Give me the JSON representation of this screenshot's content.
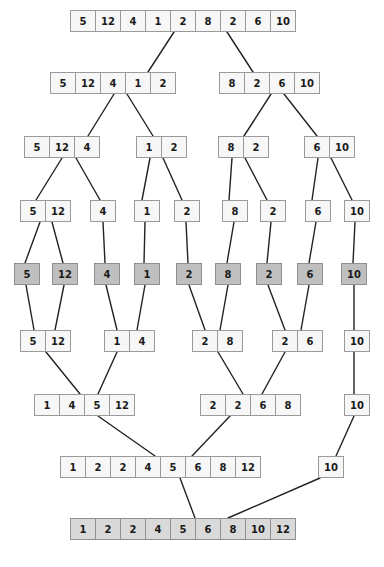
{
  "diagram": {
    "cell_width": 26,
    "cell_height": 22,
    "colors": {
      "cell_fill": "#f7f7f7",
      "base_fill": "#bfbfbf",
      "result_fill": "#d9d9d9",
      "border": "#9a9a9a",
      "edge": "#222222",
      "text": "#1a1a1a",
      "background": "#ffffff"
    },
    "levels": [
      {
        "name": "input",
        "role": "divide",
        "y": 10,
        "nodes": [
          {
            "x": 70,
            "values": [
              5,
              12,
              4,
              1,
              2,
              8,
              2,
              6,
              10
            ],
            "style": "plain"
          }
        ]
      },
      {
        "name": "divide-1",
        "role": "divide",
        "y": 72,
        "nodes": [
          {
            "x": 50,
            "values": [
              5,
              12,
              4,
              1,
              2
            ],
            "style": "plain"
          },
          {
            "x": 219,
            "values": [
              8,
              2,
              6,
              10
            ],
            "style": "plain"
          }
        ]
      },
      {
        "name": "divide-2",
        "role": "divide",
        "y": 136,
        "nodes": [
          {
            "x": 24,
            "values": [
              5,
              12,
              4
            ],
            "style": "plain"
          },
          {
            "x": 136,
            "values": [
              1,
              2
            ],
            "style": "plain"
          },
          {
            "x": 218,
            "values": [
              8,
              2
            ],
            "style": "plain"
          },
          {
            "x": 304,
            "values": [
              6,
              10
            ],
            "style": "plain"
          }
        ]
      },
      {
        "name": "divide-3",
        "role": "divide",
        "y": 200,
        "nodes": [
          {
            "x": 20,
            "values": [
              5,
              12
            ],
            "style": "plain"
          },
          {
            "x": 90,
            "values": [
              4
            ],
            "style": "plain"
          },
          {
            "x": 134,
            "values": [
              1
            ],
            "style": "plain"
          },
          {
            "x": 174,
            "values": [
              2
            ],
            "style": "plain"
          },
          {
            "x": 222,
            "values": [
              8
            ],
            "style": "plain"
          },
          {
            "x": 260,
            "values": [
              2
            ],
            "style": "plain"
          },
          {
            "x": 305,
            "values": [
              6
            ],
            "style": "plain"
          },
          {
            "x": 344,
            "values": [
              10
            ],
            "style": "plain"
          }
        ]
      },
      {
        "name": "base-case",
        "role": "base",
        "y": 263,
        "nodes": [
          {
            "x": 14,
            "values": [
              5
            ],
            "style": "base"
          },
          {
            "x": 52,
            "values": [
              12
            ],
            "style": "base"
          },
          {
            "x": 94,
            "values": [
              4
            ],
            "style": "base"
          },
          {
            "x": 134,
            "values": [
              1
            ],
            "style": "base"
          },
          {
            "x": 176,
            "values": [
              2
            ],
            "style": "base"
          },
          {
            "x": 215,
            "values": [
              8
            ],
            "style": "base"
          },
          {
            "x": 256,
            "values": [
              2
            ],
            "style": "base"
          },
          {
            "x": 297,
            "values": [
              6
            ],
            "style": "base"
          },
          {
            "x": 341,
            "values": [
              10
            ],
            "style": "base"
          }
        ]
      },
      {
        "name": "merge-1",
        "role": "merge",
        "y": 330,
        "nodes": [
          {
            "x": 20,
            "values": [
              5,
              12
            ],
            "style": "plain"
          },
          {
            "x": 104,
            "values": [
              1,
              4
            ],
            "style": "plain"
          },
          {
            "x": 192,
            "values": [
              2,
              8
            ],
            "style": "plain"
          },
          {
            "x": 272,
            "values": [
              2,
              6
            ],
            "style": "plain"
          },
          {
            "x": 344,
            "values": [
              10
            ],
            "style": "plain"
          }
        ]
      },
      {
        "name": "merge-2",
        "role": "merge",
        "y": 394,
        "nodes": [
          {
            "x": 34,
            "values": [
              1,
              4,
              5,
              12
            ],
            "style": "plain"
          },
          {
            "x": 200,
            "values": [
              2,
              2,
              6,
              8
            ],
            "style": "plain"
          },
          {
            "x": 344,
            "values": [
              10
            ],
            "style": "plain"
          }
        ]
      },
      {
        "name": "merge-3",
        "role": "merge",
        "y": 456,
        "nodes": [
          {
            "x": 60,
            "values": [
              1,
              2,
              2,
              4,
              5,
              6,
              8,
              12
            ],
            "style": "plain"
          },
          {
            "x": 318,
            "values": [
              10
            ],
            "style": "plain"
          }
        ]
      },
      {
        "name": "result",
        "role": "result",
        "y": 518,
        "nodes": [
          {
            "x": 70,
            "values": [
              1,
              2,
              2,
              4,
              5,
              6,
              8,
              10,
              12
            ],
            "style": "result"
          }
        ]
      }
    ],
    "edges": [
      {
        "x1": 174,
        "y1": 32,
        "x2": 148,
        "y2": 72
      },
      {
        "x1": 227,
        "y1": 32,
        "x2": 253,
        "y2": 72
      },
      {
        "x1": 114,
        "y1": 94,
        "x2": 88,
        "y2": 136
      },
      {
        "x1": 127,
        "y1": 94,
        "x2": 153,
        "y2": 136
      },
      {
        "x1": 271,
        "y1": 94,
        "x2": 244,
        "y2": 136
      },
      {
        "x1": 284,
        "y1": 94,
        "x2": 317,
        "y2": 136
      },
      {
        "x1": 62,
        "y1": 158,
        "x2": 36,
        "y2": 200
      },
      {
        "x1": 76,
        "y1": 158,
        "x2": 100,
        "y2": 200
      },
      {
        "x1": 150,
        "y1": 158,
        "x2": 142,
        "y2": 200
      },
      {
        "x1": 163,
        "y1": 158,
        "x2": 182,
        "y2": 200
      },
      {
        "x1": 232,
        "y1": 158,
        "x2": 229,
        "y2": 200
      },
      {
        "x1": 245,
        "y1": 158,
        "x2": 267,
        "y2": 200
      },
      {
        "x1": 318,
        "y1": 158,
        "x2": 312,
        "y2": 200
      },
      {
        "x1": 331,
        "y1": 158,
        "x2": 352,
        "y2": 200
      },
      {
        "x1": 40,
        "y1": 222,
        "x2": 25,
        "y2": 263
      },
      {
        "x1": 52,
        "y1": 222,
        "x2": 63,
        "y2": 263
      },
      {
        "x1": 103,
        "y1": 222,
        "x2": 105,
        "y2": 263
      },
      {
        "x1": 145,
        "y1": 222,
        "x2": 144,
        "y2": 263
      },
      {
        "x1": 186,
        "y1": 222,
        "x2": 188,
        "y2": 263
      },
      {
        "x1": 234,
        "y1": 222,
        "x2": 227,
        "y2": 263
      },
      {
        "x1": 271,
        "y1": 222,
        "x2": 267,
        "y2": 263
      },
      {
        "x1": 316,
        "y1": 222,
        "x2": 309,
        "y2": 263
      },
      {
        "x1": 355,
        "y1": 222,
        "x2": 353,
        "y2": 263
      },
      {
        "x1": 26,
        "y1": 285,
        "x2": 34,
        "y2": 330
      },
      {
        "x1": 64,
        "y1": 285,
        "x2": 55,
        "y2": 330
      },
      {
        "x1": 106,
        "y1": 285,
        "x2": 117,
        "y2": 330
      },
      {
        "x1": 145,
        "y1": 285,
        "x2": 137,
        "y2": 330
      },
      {
        "x1": 189,
        "y1": 285,
        "x2": 205,
        "y2": 330
      },
      {
        "x1": 228,
        "y1": 285,
        "x2": 220,
        "y2": 330
      },
      {
        "x1": 268,
        "y1": 285,
        "x2": 285,
        "y2": 330
      },
      {
        "x1": 309,
        "y1": 285,
        "x2": 301,
        "y2": 330
      },
      {
        "x1": 354,
        "y1": 285,
        "x2": 354,
        "y2": 330
      },
      {
        "x1": 46,
        "y1": 352,
        "x2": 80,
        "y2": 394
      },
      {
        "x1": 117,
        "y1": 352,
        "x2": 98,
        "y2": 394
      },
      {
        "x1": 218,
        "y1": 352,
        "x2": 243,
        "y2": 394
      },
      {
        "x1": 285,
        "y1": 352,
        "x2": 262,
        "y2": 394
      },
      {
        "x1": 354,
        "y1": 352,
        "x2": 354,
        "y2": 394
      },
      {
        "x1": 98,
        "y1": 416,
        "x2": 155,
        "y2": 456
      },
      {
        "x1": 230,
        "y1": 416,
        "x2": 192,
        "y2": 456
      },
      {
        "x1": 354,
        "y1": 416,
        "x2": 336,
        "y2": 456
      },
      {
        "x1": 180,
        "y1": 478,
        "x2": 195,
        "y2": 518
      },
      {
        "x1": 320,
        "y1": 478,
        "x2": 228,
        "y2": 518
      }
    ]
  }
}
